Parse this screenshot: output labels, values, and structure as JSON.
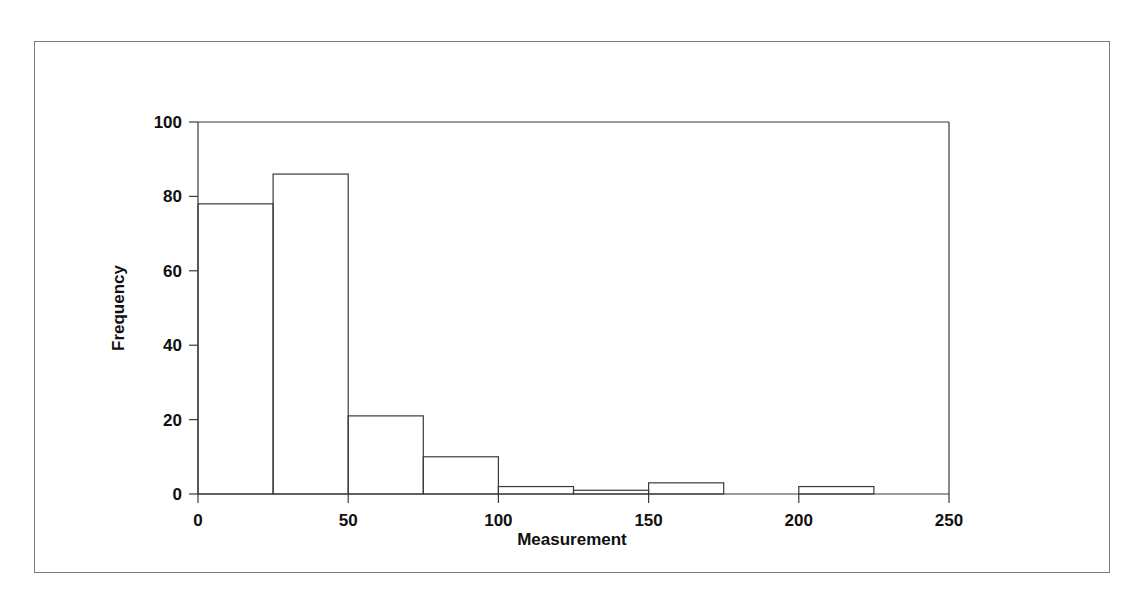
{
  "figure": {
    "background_color": "#ffffff",
    "frame_color": "#7d7d7d",
    "line_color": "#3a3a3a",
    "text_color": "#101010"
  },
  "chart_data": {
    "type": "bar",
    "chart_subtype": "histogram",
    "title": "",
    "subtitle": "",
    "xlabel": "Measurement",
    "ylabel": "Frequency",
    "xlim": [
      0,
      250
    ],
    "ylim": [
      0,
      100
    ],
    "xticks": [
      0,
      50,
      100,
      150,
      200,
      250
    ],
    "xtick_labels": [
      "0",
      "50",
      "100",
      "150",
      "200",
      "250"
    ],
    "yticks": [
      0,
      20,
      40,
      60,
      80,
      100
    ],
    "ytick_labels": [
      "0",
      "20",
      "40",
      "60",
      "80",
      "100"
    ],
    "grid": false,
    "legend": null,
    "legend_position": "none",
    "bin_width": 25,
    "bin_edges": [
      0,
      25,
      50,
      75,
      100,
      125,
      150,
      175,
      200,
      225,
      250
    ],
    "categories": [
      "0-25",
      "25-50",
      "50-75",
      "75-100",
      "100-125",
      "125-150",
      "150-175",
      "175-200",
      "200-225",
      "225-250"
    ],
    "values": [
      78,
      86,
      21,
      10,
      2,
      1,
      3,
      0,
      2,
      0
    ],
    "bar_fill": "none",
    "bar_edge_color": "#3a3a3a",
    "annotations": []
  },
  "axis": {
    "x_title": "Measurement",
    "y_title": "Frequency"
  }
}
